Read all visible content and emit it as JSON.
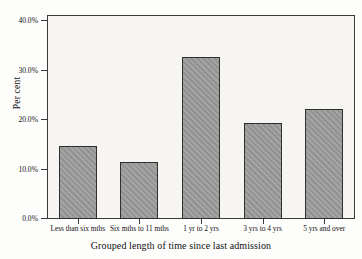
{
  "chart_data": {
    "type": "bar",
    "title": "",
    "xlabel": "Grouped length of time since last admission",
    "ylabel": "Per cent",
    "categories": [
      "Less than six mths",
      "Six mths to 11 mths",
      "1 yr to 2 yrs",
      "3 yrs to 4 yrs",
      "5 yrs and over"
    ],
    "values": [
      14.7,
      11.5,
      32.5,
      19.3,
      22.1
    ],
    "value_labels": [
      "14.7%",
      "11.5%",
      "32.5%",
      "19.3%",
      "22.1%"
    ],
    "ylim": [
      0.0,
      42.0
    ],
    "yticks": [
      0.0,
      10.0,
      20.0,
      30.0,
      40.0
    ],
    "ytick_labels": [
      "0.0%",
      "10.0%",
      "20.0%",
      "30.0%",
      "40.0%"
    ],
    "grid": false,
    "legend": null,
    "legend_position": "none",
    "bar_fill_color": "#9a9a9a",
    "bar_edge_color": "#2f2f2f",
    "plot_background_color": "#f6f4f0",
    "axis_color": "#3a3a3a"
  }
}
